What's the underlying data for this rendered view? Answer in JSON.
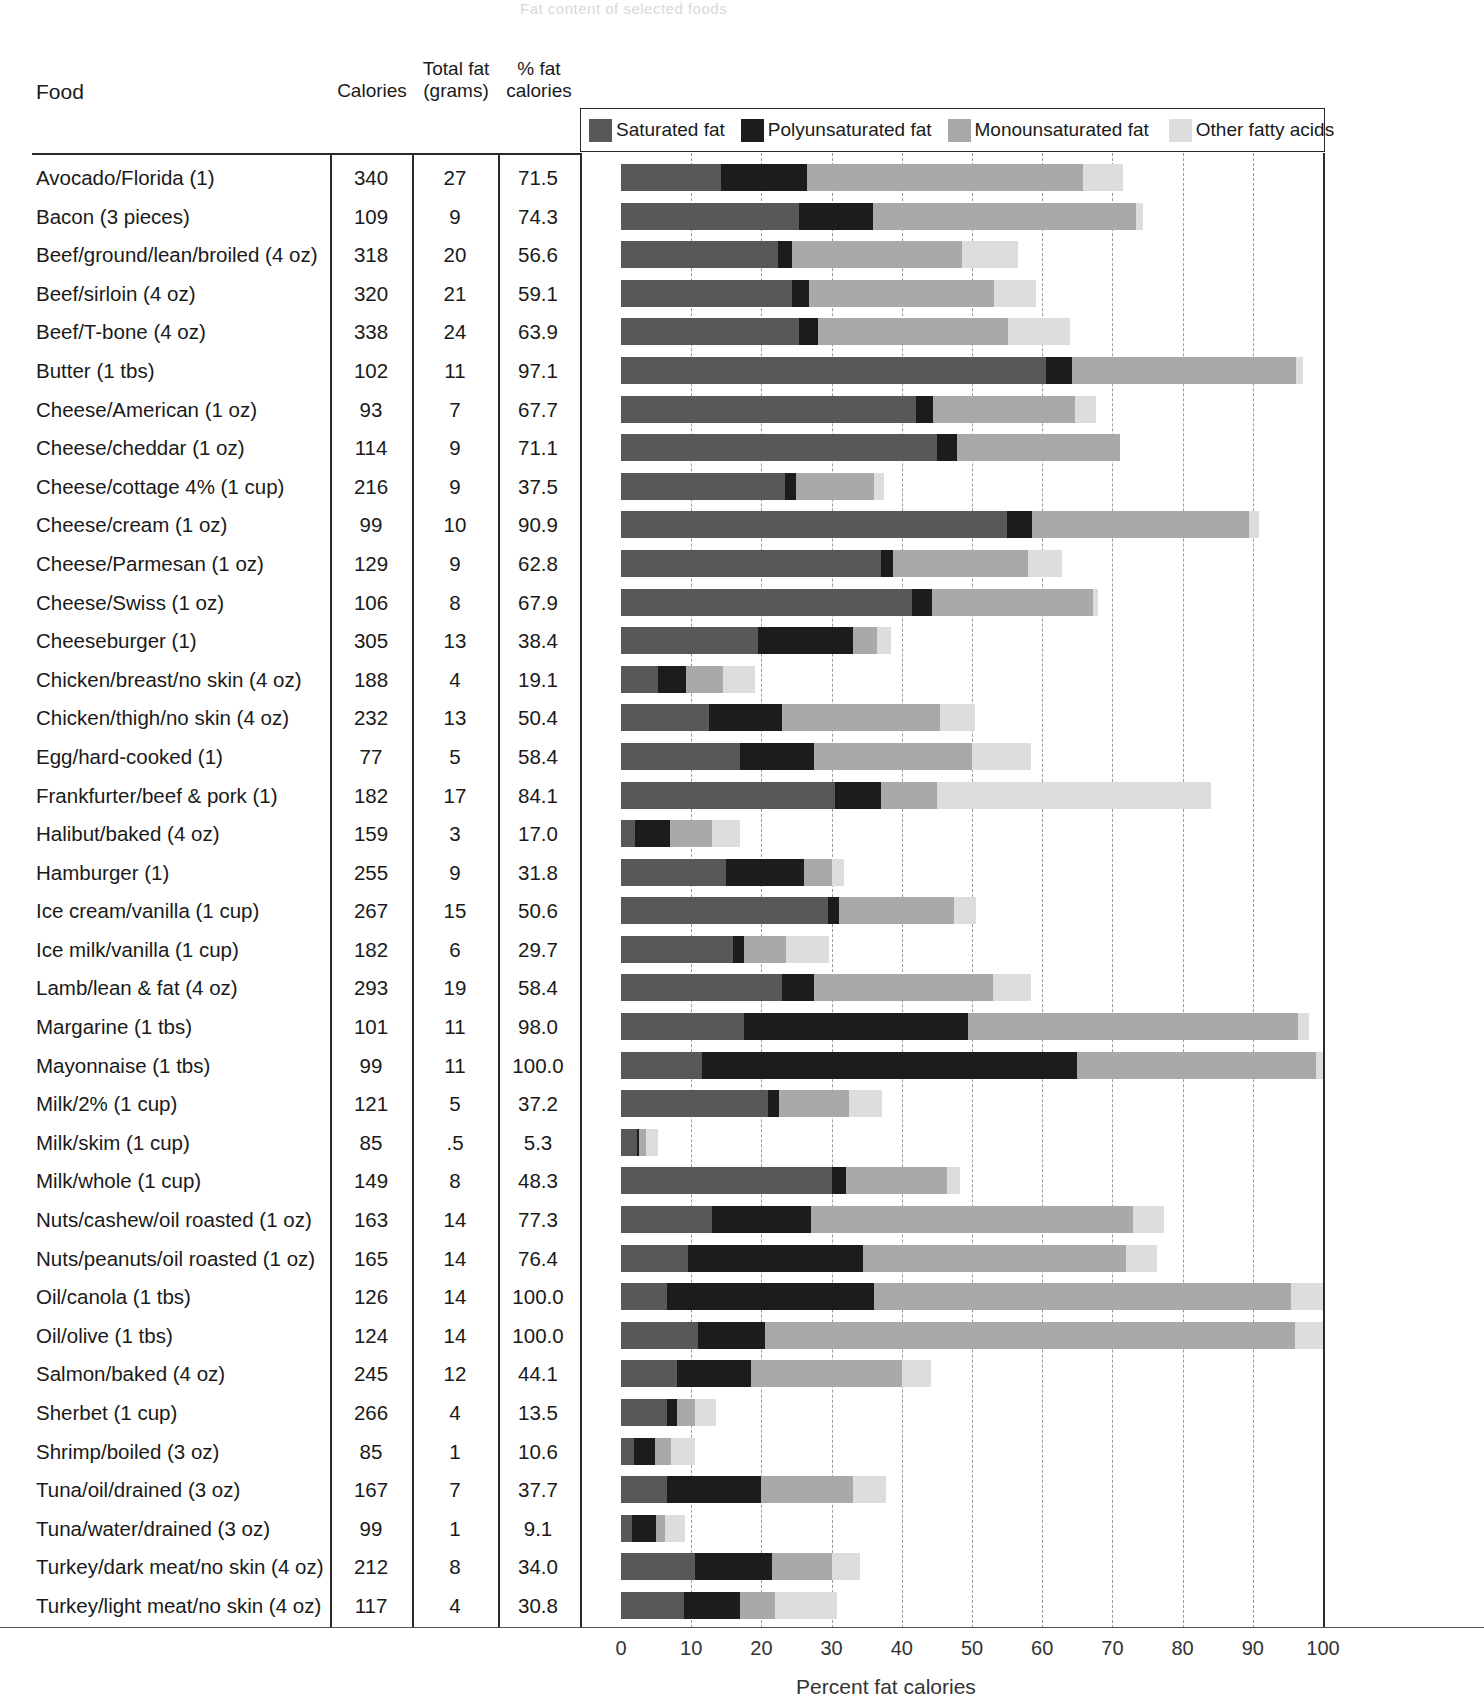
{
  "ghost_title": "Fat content of selected foods",
  "table_headers": {
    "food": "Food",
    "calories": "Calories",
    "total_fat_line1": "Total fat",
    "total_fat_line2": "(grams)",
    "pct_fat_line1": "% fat",
    "pct_fat_line2": "calories"
  },
  "legend": {
    "items": [
      {
        "label": "Saturated fat",
        "color": "#585858"
      },
      {
        "label": "Polyunsaturated fat",
        "color": "#1c1c1c"
      },
      {
        "label": "Monounsaturated fat",
        "color": "#a9a9a9"
      },
      {
        "label": "Other fatty acids",
        "color": "#dddddd"
      }
    ]
  },
  "axis": {
    "ticks": [
      "0",
      "10",
      "20",
      "30",
      "40",
      "50",
      "60",
      "70",
      "80",
      "90",
      "100"
    ],
    "title": "Percent fat calories",
    "min": 0,
    "max": 100
  },
  "chart_data": {
    "type": "bar",
    "orientation": "horizontal",
    "stacked": true,
    "title": "Fat content of selected foods",
    "xlabel": "Percent fat calories",
    "ylabel": "Food",
    "xlim": [
      0,
      100
    ],
    "grid": true,
    "legend_position": "top",
    "series": [
      {
        "name": "Saturated fat",
        "color": "#585858"
      },
      {
        "name": "Polyunsaturated fat",
        "color": "#1c1c1c"
      },
      {
        "name": "Monounsaturated fat",
        "color": "#a9a9a9"
      },
      {
        "name": "Other fatty acids",
        "color": "#dddddd"
      }
    ],
    "columns": [
      "Food",
      "Calories",
      "Total fat (grams)",
      "% fat calories"
    ],
    "rows": [
      {
        "food": "Avocado/Florida (1)",
        "calories": "340",
        "total_fat": "27",
        "pct_fat": "71.5",
        "segments": [
          14.2,
          12.3,
          39.3,
          5.7
        ]
      },
      {
        "food": "Bacon (3 pieces)",
        "calories": "109",
        "total_fat": "9",
        "pct_fat": "74.3",
        "segments": [
          25.3,
          10.6,
          37.4,
          1.0
        ]
      },
      {
        "food": "Beef/ground/lean/broiled (4 oz)",
        "calories": "318",
        "total_fat": "20",
        "pct_fat": "56.6",
        "segments": [
          22.3,
          2.0,
          24.3,
          8.0
        ]
      },
      {
        "food": "Beef/sirloin (4 oz)",
        "calories": "320",
        "total_fat": "21",
        "pct_fat": "59.1",
        "segments": [
          24.4,
          2.4,
          26.3,
          6.0
        ]
      },
      {
        "food": "Beef/T-bone (4 oz)",
        "calories": "338",
        "total_fat": "24",
        "pct_fat": "63.9",
        "segments": [
          25.3,
          2.8,
          27.0,
          8.8
        ]
      },
      {
        "food": "Butter (1 tbs)",
        "calories": "102",
        "total_fat": "11",
        "pct_fat": "97.1",
        "segments": [
          60.5,
          3.8,
          31.8,
          1.0
        ]
      },
      {
        "food": "Cheese/American (1 oz)",
        "calories": "93",
        "total_fat": "7",
        "pct_fat": "67.7",
        "segments": [
          42.0,
          2.4,
          20.3,
          3.0
        ]
      },
      {
        "food": "Cheese/cheddar (1 oz)",
        "calories": "114",
        "total_fat": "9",
        "pct_fat": "71.1",
        "segments": [
          45.0,
          2.8,
          23.3,
          0.0
        ]
      },
      {
        "food": "Cheese/cottage 4% (1 cup)",
        "calories": "216",
        "total_fat": "9",
        "pct_fat": "37.5",
        "segments": [
          23.3,
          1.7,
          11.0,
          1.5
        ]
      },
      {
        "food": "Cheese/cream (1 oz)",
        "calories": "99",
        "total_fat": "10",
        "pct_fat": "90.9",
        "segments": [
          55.0,
          3.5,
          31.0,
          1.4
        ]
      },
      {
        "food": "Cheese/Parmesan (1 oz)",
        "calories": "129",
        "total_fat": "9",
        "pct_fat": "62.8",
        "segments": [
          37.0,
          1.8,
          19.2,
          4.8
        ]
      },
      {
        "food": "Cheese/Swiss (1 oz)",
        "calories": "106",
        "total_fat": "8",
        "pct_fat": "67.9",
        "segments": [
          41.5,
          2.8,
          23.0,
          0.6
        ]
      },
      {
        "food": "Cheeseburger (1)",
        "calories": "305",
        "total_fat": "13",
        "pct_fat": "38.4",
        "segments": [
          19.5,
          13.5,
          3.5,
          1.9
        ]
      },
      {
        "food": "Chicken/breast/no skin (4 oz)",
        "calories": "188",
        "total_fat": "4",
        "pct_fat": "19.1",
        "segments": [
          5.3,
          4.0,
          5.3,
          4.5
        ]
      },
      {
        "food": "Chicken/thigh/no skin (4 oz)",
        "calories": "232",
        "total_fat": "13",
        "pct_fat": "50.4",
        "segments": [
          12.5,
          10.5,
          22.4,
          5.0
        ]
      },
      {
        "food": "Egg/hard-cooked (1)",
        "calories": "77",
        "total_fat": "5",
        "pct_fat": "58.4",
        "segments": [
          17.0,
          10.5,
          22.5,
          8.4
        ]
      },
      {
        "food": "Frankfurter/beef & pork (1)",
        "calories": "182",
        "total_fat": "17",
        "pct_fat": "84.1",
        "segments": [
          30.5,
          6.5,
          8.0,
          39.1
        ]
      },
      {
        "food": "Halibut/baked (4 oz)",
        "calories": "159",
        "total_fat": "3",
        "pct_fat": "17.0",
        "segments": [
          2.0,
          5.0,
          6.0,
          4.0
        ]
      },
      {
        "food": "Hamburger (1)",
        "calories": "255",
        "total_fat": "9",
        "pct_fat": "31.8",
        "segments": [
          15.0,
          11.0,
          4.0,
          1.8
        ]
      },
      {
        "food": "Ice cream/vanilla (1 cup)",
        "calories": "267",
        "total_fat": "15",
        "pct_fat": "50.6",
        "segments": [
          29.5,
          1.5,
          16.5,
          3.1
        ]
      },
      {
        "food": "Ice milk/vanilla (1 cup)",
        "calories": "182",
        "total_fat": "6",
        "pct_fat": "29.7",
        "segments": [
          16.0,
          1.5,
          6.0,
          6.2
        ]
      },
      {
        "food": "Lamb/lean & fat (4 oz)",
        "calories": "293",
        "total_fat": "19",
        "pct_fat": "58.4",
        "segments": [
          23.0,
          4.5,
          25.5,
          5.4
        ]
      },
      {
        "food": "Margarine (1 tbs)",
        "calories": "101",
        "total_fat": "11",
        "pct_fat": "98.0",
        "segments": [
          17.5,
          32.0,
          47.0,
          1.5
        ]
      },
      {
        "food": "Mayonnaise (1 tbs)",
        "calories": "99",
        "total_fat": "11",
        "pct_fat": "100.0",
        "segments": [
          11.5,
          53.5,
          34.0,
          1.0
        ]
      },
      {
        "food": "Milk/2% (1 cup)",
        "calories": "121",
        "total_fat": "5",
        "pct_fat": "37.2",
        "segments": [
          21.0,
          1.5,
          10.0,
          4.7
        ]
      },
      {
        "food": "Milk/skim (1 cup)",
        "calories": "85",
        "total_fat": ".5",
        "pct_fat": "5.3",
        "segments": [
          2.3,
          0.2,
          1.0,
          1.8
        ]
      },
      {
        "food": "Milk/whole (1 cup)",
        "calories": "149",
        "total_fat": "8",
        "pct_fat": "48.3",
        "segments": [
          30.0,
          2.0,
          14.5,
          1.8
        ]
      },
      {
        "food": "Nuts/cashew/oil roasted (1 oz)",
        "calories": "163",
        "total_fat": "14",
        "pct_fat": "77.3",
        "segments": [
          13.0,
          14.0,
          46.0,
          4.3
        ]
      },
      {
        "food": "Nuts/peanuts/oil roasted (1 oz)",
        "calories": "165",
        "total_fat": "14",
        "pct_fat": "76.4",
        "segments": [
          9.5,
          25.0,
          37.5,
          4.4
        ]
      },
      {
        "food": "Oil/canola (1 tbs)",
        "calories": "126",
        "total_fat": "14",
        "pct_fat": "100.0",
        "segments": [
          6.5,
          29.5,
          59.5,
          4.5
        ]
      },
      {
        "food": "Oil/olive (1 tbs)",
        "calories": "124",
        "total_fat": "14",
        "pct_fat": "100.0",
        "segments": [
          11.0,
          9.5,
          75.5,
          4.0
        ]
      },
      {
        "food": "Salmon/baked (4 oz)",
        "calories": "245",
        "total_fat": "12",
        "pct_fat": "44.1",
        "segments": [
          8.0,
          10.5,
          21.5,
          4.1
        ]
      },
      {
        "food": "Sherbet (1 cup)",
        "calories": "266",
        "total_fat": "4",
        "pct_fat": "13.5",
        "segments": [
          6.5,
          1.5,
          2.5,
          3.0
        ]
      },
      {
        "food": "Shrimp/boiled (3 oz)",
        "calories": "85",
        "total_fat": "1",
        "pct_fat": "10.6",
        "segments": [
          1.8,
          3.0,
          2.3,
          3.5
        ]
      },
      {
        "food": "Tuna/oil/drained (3 oz)",
        "calories": "167",
        "total_fat": "7",
        "pct_fat": "37.7",
        "segments": [
          6.5,
          13.5,
          13.0,
          4.7
        ]
      },
      {
        "food": "Tuna/water/drained (3 oz)",
        "calories": "99",
        "total_fat": "1",
        "pct_fat": "9.1",
        "segments": [
          1.5,
          3.5,
          1.2,
          2.9
        ]
      },
      {
        "food": "Turkey/dark meat/no skin (4 oz)",
        "calories": "212",
        "total_fat": "8",
        "pct_fat": "34.0",
        "segments": [
          10.5,
          11.0,
          8.5,
          4.0
        ]
      },
      {
        "food": "Turkey/light meat/no skin (4 oz)",
        "calories": "117",
        "total_fat": "4",
        "pct_fat": "30.8",
        "segments": [
          9.0,
          8.0,
          5.0,
          8.8
        ]
      }
    ]
  }
}
